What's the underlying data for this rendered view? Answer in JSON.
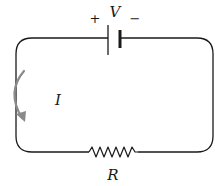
{
  "diagram": {
    "type": "circuit",
    "battery": {
      "label": "V",
      "positive_sign": "+",
      "negative_sign": "−"
    },
    "resistor": {
      "label": "R"
    },
    "current": {
      "label": "I",
      "direction": "clockwise-arrow-shown-downward-on-left",
      "arrow_color": "#8a8a8a"
    },
    "colors": {
      "wire": "#1a1a1a",
      "background": "#ffffff"
    }
  }
}
